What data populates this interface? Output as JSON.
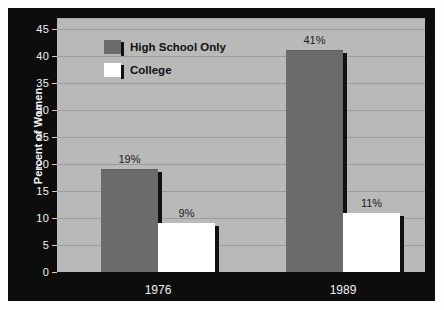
{
  "chart_data": {
    "type": "bar",
    "title": "",
    "xlabel": "",
    "ylabel": "Percent of Women",
    "categories": [
      "1976",
      "1989"
    ],
    "ylim": [
      0,
      47
    ],
    "yticks": [
      0,
      5,
      10,
      15,
      20,
      25,
      30,
      35,
      40,
      45
    ],
    "ytick_labels": [
      "0",
      "5",
      "10",
      "15",
      "20",
      "25",
      "30",
      "35",
      "40",
      "45"
    ],
    "grid": true,
    "legend_position": "top-left-inside",
    "series": [
      {
        "name": "High School Only",
        "color": "#6b6b6b",
        "values": [
          19,
          41
        ],
        "data_labels": [
          "19%",
          "41%"
        ]
      },
      {
        "name": "College",
        "color": "#ffffff",
        "values": [
          9,
          11
        ],
        "data_labels": [
          "9%",
          "11%"
        ]
      }
    ]
  },
  "style": {
    "frame_color": "#0d0d0d",
    "plot_background": "#b9b9b9",
    "gridline_color": "#9a9a9a",
    "axis_text_color": "#f2f2f2",
    "label_text_color": "#1a1a1a"
  }
}
